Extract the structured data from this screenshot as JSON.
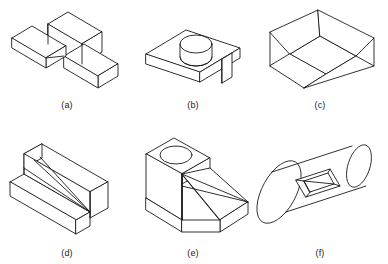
{
  "sheet": {
    "title": "Isometric pictorial views of six machine parts",
    "background_color": "#ffffff",
    "line_color": "#1a1a1a",
    "width": 388,
    "height": 264,
    "rows": 2,
    "columns": 3
  },
  "figures": [
    {
      "key": "a",
      "caption": "(a)",
      "name": "stepped-slab-with-two-arms",
      "description": "Isometric view of a tall vertical rectangular slab with two horizontal rectangular arms projecting from its base, one toward the left rear and one toward the right front.",
      "features": [
        "vertical slab",
        "left rear arm",
        "right front arm",
        "step"
      ]
    },
    {
      "key": "b",
      "caption": "(b)",
      "name": "plate-with-cylindrical-boss",
      "description": "Isometric view of a flat rectangular plate carrying a short cylindrical boss on its top face and a downward rectangular tab at the right rear edge.",
      "features": [
        "flat plate",
        "cylindrical boss",
        "downward tab"
      ]
    },
    {
      "key": "c",
      "caption": "(c)",
      "name": "open-tray-with-flared-walls",
      "description": "Isometric view of an open rectangular tray with a flat floor and four outward sloping flared side walls.",
      "features": [
        "flat floor",
        "flared front wall",
        "flared rear wall",
        "flared side walls",
        "open top"
      ]
    },
    {
      "key": "d",
      "caption": "(d)",
      "name": "stepped-block-with-diagonal-ramp",
      "description": "Isometric view of a stepped block with a low front ledge and a tall rear wall, joined by a triangular diagonal ramp running from the top rear corner down to the front right corner.",
      "features": [
        "low front ledge",
        "tall rear wall",
        "diagonal ramp",
        "step"
      ]
    },
    {
      "key": "e",
      "caption": "(e)",
      "name": "wedge-block-with-through-hole",
      "description": "Isometric view of a wedge shaped block whose upper rear face carries a circular through hole, with a large inclined triangular ramp sweeping down to the lower front right corner.",
      "features": [
        "rectangular base",
        "raised top pad",
        "circular through hole",
        "inclined triangular ramp"
      ]
    },
    {
      "key": "f",
      "caption": "(f)",
      "name": "cylinder-with-rectangular-slot",
      "description": "Isometric view of a horizontal cylinder inclined across the frame with a rectangular pocket milled into its upper curved surface, showing the inner slot walls and floor.",
      "features": [
        "cylindrical body",
        "elliptical end face",
        "rectangular milled slot",
        "visible slot walls"
      ]
    }
  ]
}
